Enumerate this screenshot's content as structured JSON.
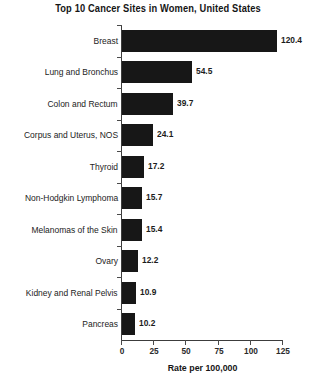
{
  "chart_data": {
    "type": "bar",
    "orientation": "horizontal",
    "title": "Top 10 Cancer Sites in Women, United States",
    "xlabel": "Rate per 100,000",
    "ylabel": "",
    "categories": [
      "Breast",
      "Lung and Bronchus",
      "Colon and Rectum",
      "Corpus and Uterus, NOS",
      "Thyroid",
      "Non-Hodgkin Lymphoma",
      "Melanomas of the Skin",
      "Ovary",
      "Kidney and Renal Pelvis",
      "Pancreas"
    ],
    "values": [
      120.4,
      54.5,
      39.7,
      24.1,
      17.2,
      15.7,
      15.4,
      12.2,
      10.9,
      10.2
    ],
    "value_labels": [
      "120.4",
      "54.5",
      "39.7",
      "24.1",
      "17.2",
      "15.7",
      "15.4",
      "12.2",
      "10.9",
      "10.2"
    ],
    "xlim": [
      0,
      125
    ],
    "xticks": [
      0,
      25,
      50,
      75,
      100,
      125
    ],
    "xtick_labels": [
      "0",
      "25",
      "50",
      "75",
      "100",
      "125"
    ],
    "grid": false,
    "legend": null,
    "bar_color": "#171717",
    "axis_color": "#3c3c3c",
    "background_color": "#ffffff"
  }
}
